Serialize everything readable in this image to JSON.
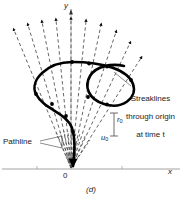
{
  "figure": {
    "caption": "(d)",
    "axes": {
      "x_label": "x",
      "y_label": "y",
      "origin_label": "0"
    },
    "annotations": {
      "streaklines": {
        "line1": "Streaklines",
        "line2": "through origin",
        "line3": "at time t"
      },
      "pathline": "Pathline",
      "r0": {
        "symbol": "r",
        "subscript": "0"
      },
      "u0": {
        "symbol": "u",
        "subscript": "0"
      }
    },
    "colors": {
      "ink": "#1a1a1a",
      "pathline": "#000000",
      "streakline": "#4a4a4a",
      "axis": "#8a8a8a",
      "background": "#ffffff"
    }
  }
}
